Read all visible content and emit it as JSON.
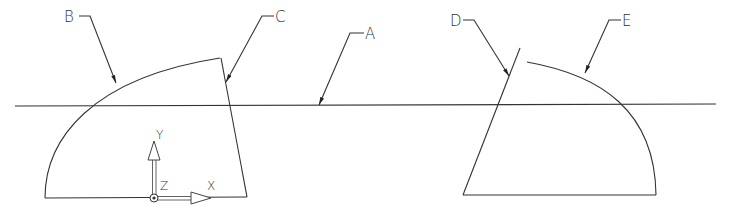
{
  "diagram": {
    "type": "cad-section-drawing",
    "labels": {
      "A": "A",
      "B": "B",
      "C": "C",
      "D": "D",
      "E": "E"
    },
    "ucs": {
      "x_label": "X",
      "y_label": "Y",
      "z_label": "Z"
    },
    "colors": {
      "line": "#333333",
      "background": "#ffffff"
    }
  }
}
